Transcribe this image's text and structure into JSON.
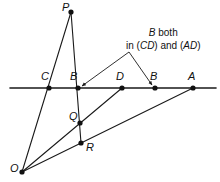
{
  "figure": {
    "background_color": "#ffffff",
    "stroke_color": "#1a1a1a",
    "point_color": "#111111",
    "width": 220,
    "height": 182
  },
  "annotation": {
    "line1_italic": "B",
    "line1_rest": " both",
    "line2_prefix": "in (",
    "line2_italic1": "CD",
    "line2_middle": ") and (",
    "line2_italic2": "AD",
    "line2_suffix": ")"
  },
  "points": [
    {
      "id": "P",
      "label": "P",
      "x": 71,
      "y": 12,
      "label_x": 62,
      "label_y": 2
    },
    {
      "id": "C",
      "label": "C",
      "x": 49,
      "y": 88,
      "label_x": 41,
      "label_y": 71
    },
    {
      "id": "B1",
      "label": "B",
      "x": 78,
      "y": 88,
      "label_x": 70,
      "label_y": 71
    },
    {
      "id": "D",
      "label": "D",
      "x": 122,
      "y": 88,
      "label_x": 116,
      "label_y": 71
    },
    {
      "id": "B2",
      "label": "B",
      "x": 155,
      "y": 88,
      "label_x": 150,
      "label_y": 71
    },
    {
      "id": "A",
      "label": "A",
      "x": 193,
      "y": 88,
      "label_x": 188,
      "label_y": 71
    },
    {
      "id": "Q",
      "label": "Q",
      "x": 80,
      "y": 123,
      "label_x": 69,
      "label_y": 111
    },
    {
      "id": "R",
      "label": "R",
      "x": 81,
      "y": 143,
      "label_x": 86,
      "label_y": 142
    },
    {
      "id": "O",
      "label": "O",
      "x": 22,
      "y": 172,
      "label_x": 10,
      "label_y": 163
    }
  ],
  "segments": [
    {
      "name": "horizontal-line",
      "x1": 10,
      "y1": 88,
      "x2": 216,
      "y2": 88,
      "width": 1.6
    },
    {
      "name": "segment-P-C-O",
      "x1": 71,
      "y1": 12,
      "x2": 22,
      "y2": 172,
      "width": 1.1
    },
    {
      "name": "segment-P-B-R",
      "x1": 71,
      "y1": 12,
      "x2": 81,
      "y2": 143,
      "width": 1.1
    },
    {
      "name": "segment-O-Q-D",
      "x1": 22,
      "y1": 172,
      "x2": 122,
      "y2": 88,
      "width": 1.1
    },
    {
      "name": "segment-O-R-A",
      "x1": 22,
      "y1": 172,
      "x2": 193,
      "y2": 88,
      "width": 1.1
    }
  ],
  "arrows": [
    {
      "name": "arrow-to-B1",
      "x1": 129,
      "y1": 52,
      "x2": 82,
      "y2": 86,
      "width": 0.9
    },
    {
      "name": "arrow-to-B2",
      "x1": 129,
      "y1": 52,
      "x2": 152,
      "y2": 85,
      "width": 0.9
    }
  ]
}
